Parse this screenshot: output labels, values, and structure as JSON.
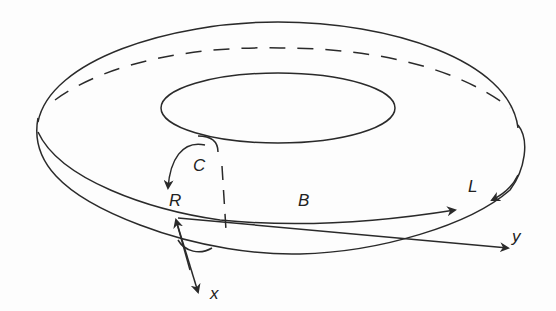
{
  "figure": {
    "stroke_color": "#2a2a2a",
    "background": "#fdfdfd",
    "labels": {
      "C": "C",
      "R": "R",
      "B": "B",
      "L": "L",
      "x": "x",
      "y": "y"
    }
  }
}
